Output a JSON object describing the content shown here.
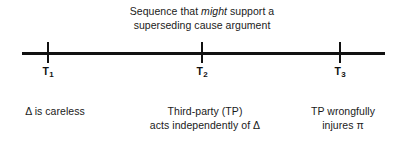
{
  "figure": {
    "title": {
      "line1_before_em": "Sequence that ",
      "line1_em": "might",
      "line1_after_em": " support a",
      "line2": "superseding cause argument"
    },
    "timeline": {
      "ticks": [
        {
          "id": "T1",
          "label_base": "T",
          "label_sub": "1",
          "caption_lines": [
            "Δ is careless"
          ]
        },
        {
          "id": "T2",
          "label_base": "T",
          "label_sub": "2",
          "caption_lines": [
            "Third-party (TP)",
            "acts independently of Δ"
          ]
        },
        {
          "id": "T3",
          "label_base": "T",
          "label_sub": "3",
          "caption_lines": [
            "TP wrongfully",
            "injures π"
          ]
        }
      ]
    },
    "colors": {
      "background": "#ffffff",
      "axis": "#111111",
      "text": "#1a1a1a"
    }
  }
}
